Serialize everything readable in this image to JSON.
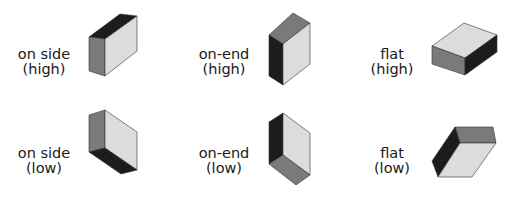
{
  "colors": {
    "dark": "#1c1c1c",
    "medium": "#7a7a7a",
    "light": "#dcdcdc"
  },
  "orientations": [
    {
      "line1": "on side",
      "line2": "(high)"
    },
    {
      "line1": "on-end",
      "line2": "(high)"
    },
    {
      "line1": "flat",
      "line2": "(high)"
    },
    {
      "line1": "on side",
      "line2": "(low)"
    },
    {
      "line1": "on-end",
      "line2": "(low)"
    },
    {
      "line1": "flat",
      "line2": "(low)"
    }
  ]
}
